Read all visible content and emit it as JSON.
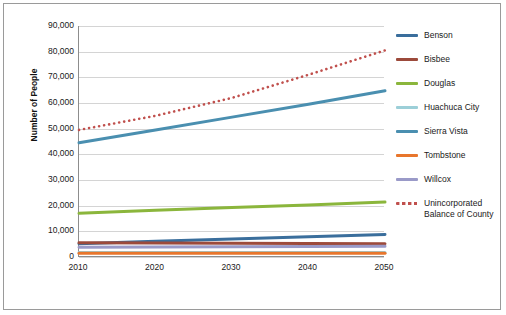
{
  "chart_data": {
    "type": "line",
    "title": "",
    "xlabel": "",
    "ylabel": "Number of People",
    "x": [
      2010,
      2020,
      2030,
      2040,
      2050
    ],
    "xlim": [
      2010,
      2050
    ],
    "ylim": [
      0,
      90000
    ],
    "yticks": [
      0,
      10000,
      20000,
      30000,
      40000,
      50000,
      60000,
      70000,
      80000,
      90000
    ],
    "ytick_labels": [
      "0",
      "10,000",
      "20,000",
      "30,000",
      "40,000",
      "50,000",
      "60,000",
      "70,000",
      "80,000",
      "90,000"
    ],
    "xtick_labels": [
      "2010",
      "2020",
      "2030",
      "2040",
      "2050"
    ],
    "grid": "horizontal",
    "legend_position": "right",
    "series": [
      {
        "name": "Benson",
        "color": "#3a6e9c",
        "style": "solid",
        "values": [
          5200,
          6100,
          7000,
          7900,
          8800
        ]
      },
      {
        "name": "Bisbee",
        "color": "#9c4a3b",
        "style": "solid",
        "values": [
          5600,
          5500,
          5400,
          5300,
          5200
        ]
      },
      {
        "name": "Douglas",
        "color": "#8bb63c",
        "style": "solid",
        "values": [
          17000,
          18200,
          19300,
          20300,
          21400
        ]
      },
      {
        "name": "Huachuca City",
        "color": "#9ccfd8",
        "style": "solid",
        "values": [
          1800,
          1800,
          1800,
          1800,
          1800
        ]
      },
      {
        "name": "Sierra Vista",
        "color": "#4a8fb0",
        "style": "solid",
        "values": [
          44500,
          49500,
          54500,
          59500,
          64800
        ]
      },
      {
        "name": "Tombstone",
        "color": "#e8762c",
        "style": "solid",
        "values": [
          1500,
          1500,
          1500,
          1500,
          1500
        ]
      },
      {
        "name": "Willcox",
        "color": "#9a9ac8",
        "style": "solid",
        "values": [
          3800,
          3900,
          4000,
          4100,
          4200
        ]
      },
      {
        "name": "Unincorporated Balance of County",
        "color": "#c0504d",
        "style": "dotted",
        "values": [
          49500,
          55000,
          62000,
          71000,
          80500
        ]
      }
    ]
  },
  "legend": {
    "items": [
      {
        "label": "Benson"
      },
      {
        "label": "Bisbee"
      },
      {
        "label": "Douglas"
      },
      {
        "label": "Huachuca City"
      },
      {
        "label": "Sierra Vista"
      },
      {
        "label": "Tombstone"
      },
      {
        "label": "Willcox"
      },
      {
        "label": "Unincorporated Balance of County"
      }
    ]
  }
}
